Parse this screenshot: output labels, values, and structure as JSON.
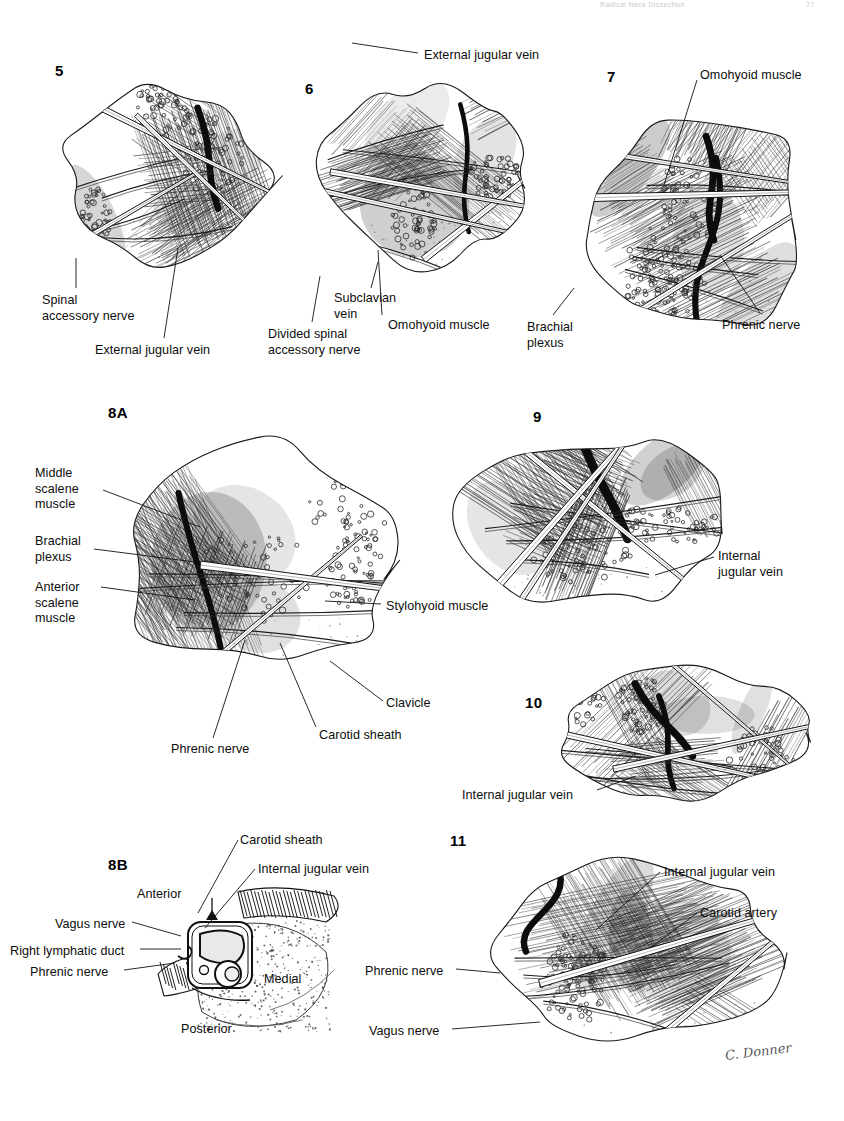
{
  "page": {
    "width": 844,
    "height": 1121,
    "background": "#ffffff",
    "ink": "#111111",
    "running_head": {
      "title": "Radical Neck Dissection",
      "page_number": "77"
    },
    "artist_signature": "C. Donner"
  },
  "figures": [
    {
      "id": "fig-5",
      "number": "5",
      "number_pos": {
        "x": 55,
        "y": 62
      },
      "art": {
        "x": 40,
        "y": 68,
        "w": 250,
        "h": 215
      },
      "labels": [
        {
          "name": "spinal-accessory-nerve",
          "text": "Spinal\naccessory nerve",
          "x": 42,
          "y": 293,
          "align": "left"
        },
        {
          "name": "external-jugular-vein",
          "text": "External jugular vein",
          "x": 95,
          "y": 343,
          "align": "left"
        }
      ],
      "leaders": [
        {
          "x1": 76,
          "y1": 288,
          "x2": 76,
          "y2": 258
        },
        {
          "x1": 164,
          "y1": 338,
          "x2": 178,
          "y2": 248
        }
      ]
    },
    {
      "id": "fig-6",
      "number": "6",
      "number_pos": {
        "x": 305,
        "y": 80
      },
      "art": {
        "x": 300,
        "y": 60,
        "w": 255,
        "h": 230
      },
      "labels": [
        {
          "name": "external-jugular-vein",
          "text": "External jugular vein",
          "x": 424,
          "y": 48,
          "align": "left"
        },
        {
          "name": "subclavian-vein",
          "text": "Subclavian\nvein",
          "x": 334,
          "y": 291,
          "align": "left"
        },
        {
          "name": "omohyoid-muscle",
          "text": "Omohyoid muscle",
          "x": 388,
          "y": 318,
          "align": "left"
        },
        {
          "name": "divided-spinal-accessory-nerve",
          "text": "Divided spinal\naccessory nerve",
          "x": 268,
          "y": 327,
          "align": "left"
        }
      ],
      "leaders": [
        {
          "x1": 418,
          "y1": 53,
          "x2": 352,
          "y2": 43
        },
        {
          "x1": 371,
          "y1": 288,
          "x2": 378,
          "y2": 262
        },
        {
          "x1": 382,
          "y1": 315,
          "x2": 378,
          "y2": 250
        },
        {
          "x1": 312,
          "y1": 322,
          "x2": 320,
          "y2": 276
        }
      ]
    },
    {
      "id": "fig-7",
      "number": "7",
      "number_pos": {
        "x": 607,
        "y": 68
      },
      "art": {
        "x": 570,
        "y": 70,
        "w": 265,
        "h": 300
      },
      "labels": [
        {
          "name": "omohyoid-muscle",
          "text": "Omohyoid muscle",
          "x": 700,
          "y": 68,
          "align": "left"
        },
        {
          "name": "brachial-plexus",
          "text": "Brachial\nplexus",
          "x": 527,
          "y": 320,
          "align": "left"
        },
        {
          "name": "phrenic-nerve",
          "text": "Phrenic nerve",
          "x": 722,
          "y": 318,
          "align": "left"
        }
      ],
      "leaders": [
        {
          "x1": 697,
          "y1": 80,
          "x2": 664,
          "y2": 185
        },
        {
          "x1": 553,
          "y1": 315,
          "x2": 574,
          "y2": 288
        },
        {
          "x1": 760,
          "y1": 313,
          "x2": 720,
          "y2": 255
        }
      ]
    },
    {
      "id": "fig-8A",
      "number": "8A",
      "number_pos": {
        "x": 108,
        "y": 404
      },
      "art": {
        "x": 85,
        "y": 415,
        "w": 345,
        "h": 290
      },
      "labels": [
        {
          "name": "middle-scalene-muscle",
          "text": "Middle\nscalene\nmuscle",
          "x": 35,
          "y": 466,
          "align": "left"
        },
        {
          "name": "brachial-plexus",
          "text": "Brachial\nplexus",
          "x": 35,
          "y": 534,
          "align": "left"
        },
        {
          "name": "anterior-scalene-muscle",
          "text": "Anterior\nscalene\nmuscle",
          "x": 35,
          "y": 580,
          "align": "left"
        },
        {
          "name": "stylohyoid-muscle",
          "text": "Stylohyoid muscle",
          "x": 386,
          "y": 599,
          "align": "left"
        },
        {
          "name": "clavicle",
          "text": "Clavicle",
          "x": 386,
          "y": 696,
          "align": "left"
        },
        {
          "name": "carotid-sheath",
          "text": "Carotid sheath",
          "x": 319,
          "y": 728,
          "align": "left"
        },
        {
          "name": "phrenic-nerve",
          "text": "Phrenic nerve",
          "x": 171,
          "y": 742,
          "align": "left"
        }
      ],
      "leaders": [
        {
          "x1": 103,
          "y1": 490,
          "x2": 200,
          "y2": 527
        },
        {
          "x1": 94,
          "y1": 549,
          "x2": 195,
          "y2": 562
        },
        {
          "x1": 101,
          "y1": 587,
          "x2": 195,
          "y2": 600
        },
        {
          "x1": 381,
          "y1": 604,
          "x2": 325,
          "y2": 601
        },
        {
          "x1": 383,
          "y1": 701,
          "x2": 330,
          "y2": 661
        },
        {
          "x1": 316,
          "y1": 727,
          "x2": 280,
          "y2": 643
        },
        {
          "x1": 213,
          "y1": 738,
          "x2": 245,
          "y2": 640
        }
      ]
    },
    {
      "id": "fig-9",
      "number": "9",
      "number_pos": {
        "x": 533,
        "y": 408
      },
      "art": {
        "x": 440,
        "y": 410,
        "w": 330,
        "h": 220
      },
      "labels": [
        {
          "name": "internal-jugular-vein",
          "text": "Internal\njugular vein",
          "x": 718,
          "y": 549,
          "align": "left"
        }
      ],
      "leaders": [
        {
          "x1": 714,
          "y1": 557,
          "x2": 655,
          "y2": 575
        }
      ]
    },
    {
      "id": "fig-10",
      "number": "10",
      "number_pos": {
        "x": 525,
        "y": 694
      },
      "art": {
        "x": 520,
        "y": 650,
        "w": 320,
        "h": 165
      },
      "labels": [
        {
          "name": "internal-jugular-vein",
          "text": "Internal jugular vein",
          "x": 462,
          "y": 788,
          "align": "left"
        }
      ],
      "leaders": [
        {
          "x1": 597,
          "y1": 790,
          "x2": 636,
          "y2": 776
        }
      ]
    },
    {
      "id": "fig-8B",
      "number": "8B",
      "number_pos": {
        "x": 108,
        "y": 856
      },
      "art": {
        "x": 120,
        "y": 870,
        "w": 245,
        "h": 180
      },
      "labels": [
        {
          "name": "carotid-sheath",
          "text": "Carotid sheath",
          "x": 240,
          "y": 833,
          "align": "left"
        },
        {
          "name": "internal-jugular-vein",
          "text": "Internal jugular vein",
          "x": 258,
          "y": 862,
          "align": "left"
        },
        {
          "name": "anterior",
          "text": "Anterior",
          "x": 137,
          "y": 887,
          "align": "left"
        },
        {
          "name": "vagus-nerve",
          "text": "Vagus nerve",
          "x": 55,
          "y": 917,
          "align": "left"
        },
        {
          "name": "right-lymphatic-duct",
          "text": "Right lymphatic duct",
          "x": 10,
          "y": 944,
          "align": "left"
        },
        {
          "name": "phrenic-nerve",
          "text": "Phrenic nerve",
          "x": 30,
          "y": 965,
          "align": "left"
        },
        {
          "name": "medial",
          "text": "Medial",
          "x": 264,
          "y": 972,
          "align": "left"
        },
        {
          "name": "posterior",
          "text": "Posterior",
          "x": 181,
          "y": 1022,
          "align": "left"
        }
      ],
      "leaders": [
        {
          "x1": 238,
          "y1": 840,
          "x2": 198,
          "y2": 913
        },
        {
          "x1": 255,
          "y1": 869,
          "x2": 205,
          "y2": 928
        },
        {
          "x1": 132,
          "y1": 922,
          "x2": 181,
          "y2": 936
        },
        {
          "x1": 140,
          "y1": 949,
          "x2": 181,
          "y2": 949
        },
        {
          "x1": 124,
          "y1": 970,
          "x2": 175,
          "y2": 963
        }
      ]
    },
    {
      "id": "fig-11",
      "number": "11",
      "number_pos": {
        "x": 450,
        "y": 832
      },
      "art": {
        "x": 455,
        "y": 840,
        "w": 360,
        "h": 225
      },
      "labels": [
        {
          "name": "internal-jugular-vein",
          "text": "Internal jugular vein",
          "x": 664,
          "y": 865,
          "align": "left"
        },
        {
          "name": "carotid-artery",
          "text": "Carotid artery",
          "x": 700,
          "y": 906,
          "align": "left"
        },
        {
          "name": "phrenic-nerve",
          "text": "Phrenic nerve",
          "x": 365,
          "y": 964,
          "align": "left"
        },
        {
          "name": "vagus-nerve",
          "text": "Vagus nerve",
          "x": 369,
          "y": 1024,
          "align": "left"
        }
      ],
      "leaders": [
        {
          "x1": 660,
          "y1": 872,
          "x2": 596,
          "y2": 930
        },
        {
          "x1": 697,
          "y1": 913,
          "x2": 650,
          "y2": 948
        },
        {
          "x1": 456,
          "y1": 969,
          "x2": 500,
          "y2": 973
        },
        {
          "x1": 452,
          "y1": 1029,
          "x2": 540,
          "y2": 1022
        }
      ]
    }
  ]
}
